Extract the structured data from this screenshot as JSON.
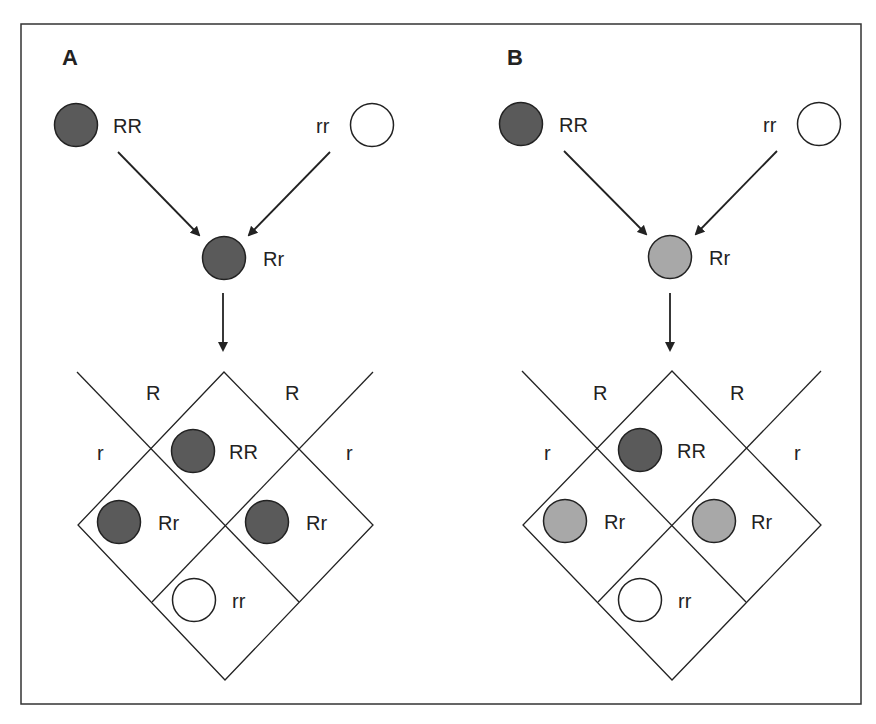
{
  "colors": {
    "frame": "#333333",
    "line": "#222222",
    "dominant": "#5a5a5a",
    "intermediate": "#a8a8a8",
    "recessive": "#ffffff",
    "circle_stroke": "#222222"
  },
  "panels": [
    {
      "label": "A",
      "description": "Complete dominance",
      "parents": [
        {
          "genotype": "RR",
          "phenotype": "dominant"
        },
        {
          "genotype": "rr",
          "phenotype": "recessive"
        }
      ],
      "f1": {
        "genotype": "Rr",
        "phenotype": "dominant"
      },
      "punnett": {
        "gametes_top": [
          "R",
          "R"
        ],
        "gametes_side": [
          "r",
          "r"
        ],
        "cells": [
          {
            "genotype": "RR",
            "phenotype": "dominant"
          },
          {
            "genotype": "Rr",
            "phenotype": "dominant"
          },
          {
            "genotype": "Rr",
            "phenotype": "dominant"
          },
          {
            "genotype": "rr",
            "phenotype": "recessive"
          }
        ]
      }
    },
    {
      "label": "B",
      "description": "Incomplete dominance",
      "parents": [
        {
          "genotype": "RR",
          "phenotype": "dominant"
        },
        {
          "genotype": "rr",
          "phenotype": "recessive"
        }
      ],
      "f1": {
        "genotype": "Rr",
        "phenotype": "intermediate"
      },
      "punnett": {
        "gametes_top": [
          "R",
          "R"
        ],
        "gametes_side": [
          "r",
          "r"
        ],
        "cells": [
          {
            "genotype": "RR",
            "phenotype": "dominant"
          },
          {
            "genotype": "Rr",
            "phenotype": "intermediate"
          },
          {
            "genotype": "Rr",
            "phenotype": "intermediate"
          },
          {
            "genotype": "rr",
            "phenotype": "recessive"
          }
        ]
      }
    }
  ]
}
